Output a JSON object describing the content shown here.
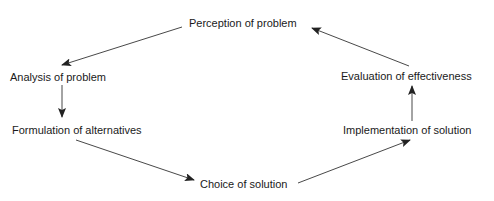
{
  "diagram": {
    "type": "cycle",
    "nodes": [
      {
        "id": "perception",
        "label": "Perception of problem"
      },
      {
        "id": "analysis",
        "label": "Analysis of problem"
      },
      {
        "id": "formulation",
        "label": "Formulation of alternatives"
      },
      {
        "id": "choice",
        "label": "Choice of solution"
      },
      {
        "id": "implementation",
        "label": "Implementation of solution"
      },
      {
        "id": "evaluation",
        "label": "Evaluation of effectiveness"
      }
    ],
    "edges": [
      {
        "from": "perception",
        "to": "analysis"
      },
      {
        "from": "analysis",
        "to": "formulation"
      },
      {
        "from": "formulation",
        "to": "choice"
      },
      {
        "from": "choice",
        "to": "implementation"
      },
      {
        "from": "implementation",
        "to": "evaluation"
      },
      {
        "from": "evaluation",
        "to": "perception"
      }
    ],
    "colors": {
      "line": "#333333",
      "text": "#1a1a1a"
    }
  }
}
